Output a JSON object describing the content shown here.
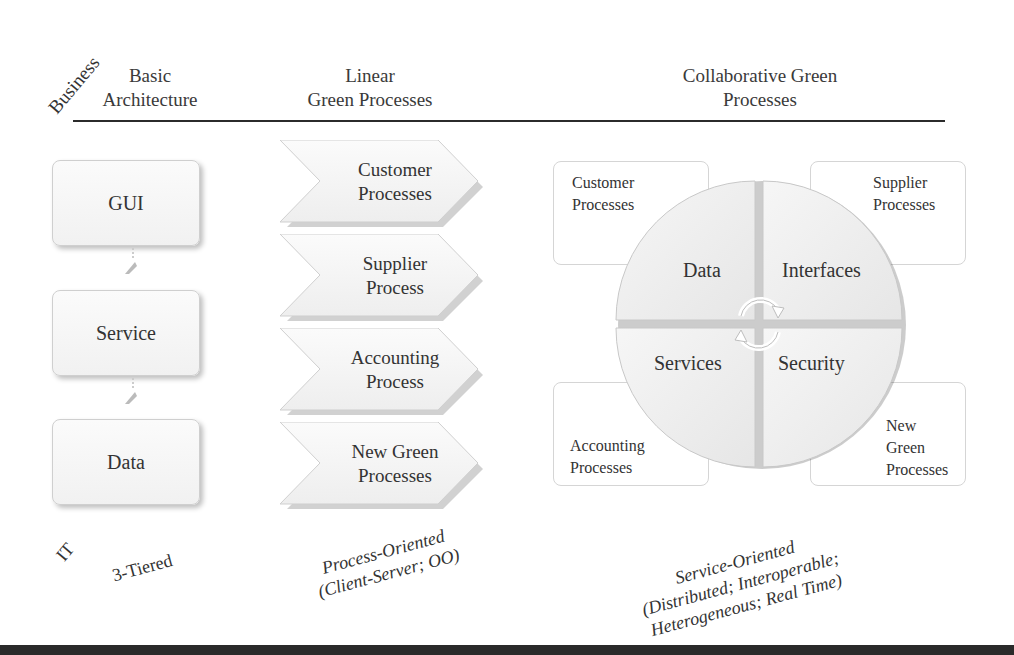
{
  "axis_labels": {
    "top": "Business",
    "bottom": "IT"
  },
  "columns": [
    {
      "header_line1": "Basic",
      "header_line2": "Architecture",
      "footer": [
        "3-Tiered"
      ]
    },
    {
      "header_line1": "Linear",
      "header_line2": "Green Processes",
      "footer": [
        "Process-Oriented",
        "(Client-Server; OO)"
      ]
    },
    {
      "header_line1": "Collaborative Green",
      "header_line2": "Processes",
      "footer": [
        "Service-Oriented",
        "(Distributed; Interoperable;",
        "Heterogeneous; Real Time)"
      ]
    }
  ],
  "tiers": [
    "GUI",
    "Service",
    "Data"
  ],
  "linear_processes": [
    {
      "line1": "Customer",
      "line2": "Processes"
    },
    {
      "line1": "Supplier",
      "line2": "Process"
    },
    {
      "line1": "Accounting",
      "line2": "Process"
    },
    {
      "line1": "New Green",
      "line2": "Processes"
    }
  ],
  "collab_corners": {
    "top_left": [
      "Customer",
      "Processes"
    ],
    "top_right": [
      "Supplier",
      "Processes"
    ],
    "bottom_left": [
      "Accounting",
      "Processes"
    ],
    "bottom_right": [
      "New",
      "Green",
      "Processes"
    ]
  },
  "quadrants": {
    "top_left": "Data",
    "top_right": "Interfaces",
    "bottom_left": "Services",
    "bottom_right": "Security"
  },
  "center_icon": "cycle-arrows-icon"
}
